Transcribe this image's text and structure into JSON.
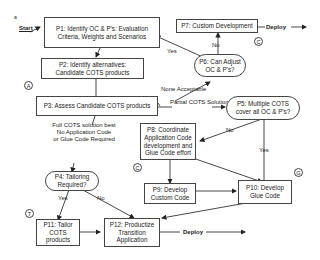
{
  "diagram": {
    "start_label": "Start",
    "start_marker": "a",
    "nodes": {
      "p1": {
        "label": "P1: Identify OC & P's: Evaluation Criteria, Weights and Scenarios"
      },
      "p2": {
        "label": "P2: Identify alternatives: Candidate COTS products"
      },
      "p3": {
        "label": "P3: Assess Candidate COTS products"
      },
      "p4": {
        "label": "P4: Tailoring Required?"
      },
      "p5": {
        "label": "P5: Multiple COTS cover all OC & P's?"
      },
      "p6": {
        "label": "P6: Can Adjust OC & P's?"
      },
      "p7": {
        "label": "P7: Custom Development"
      },
      "p8": {
        "label": "P8: Coordinate Application Code development and Glue Code effort"
      },
      "p9": {
        "label": "P9: Develop Custom Code"
      },
      "p10": {
        "label": "P10: Develop Glue Code"
      },
      "p11": {
        "label": "P11: Tailor COTS products"
      },
      "p12": {
        "label": "P12: Productize Transition Application"
      }
    },
    "edge_labels": {
      "none_acceptable": "None Acceptable",
      "partial_cots": "Partial COTS Solution Best",
      "full_cots_line1": "Full COTS solution best",
      "full_cots_line2": "No Application Code",
      "full_cots_line3": "or Glue Code Required",
      "p6_yes": "Yes",
      "p6_no": "No",
      "p5_no": "No",
      "p5_yes": "Yes",
      "p4_yes": "Yes",
      "p4_no": "No",
      "deploy_top": "Deploy",
      "deploy_bottom": "Deploy"
    },
    "markers": {
      "a": "A",
      "c_top": "C",
      "c_mid": "C",
      "g": "G",
      "t": "T"
    }
  }
}
